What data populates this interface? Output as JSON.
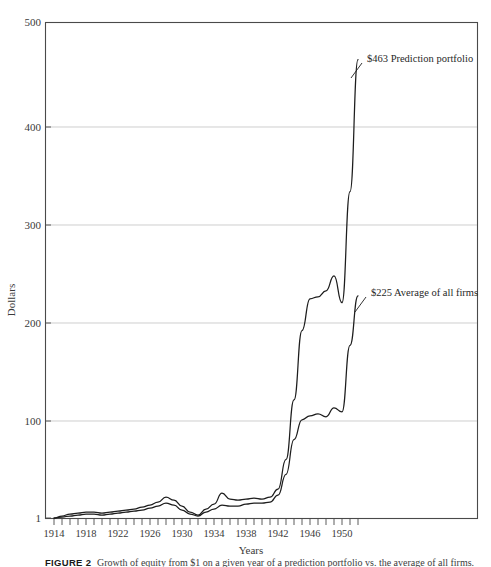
{
  "figure": {
    "caption_label": "FIGURE 2",
    "caption_text": "Growth of equity from $1 on a given year of a prediction portfolio vs. the average of all firms."
  },
  "chart_data": {
    "type": "line",
    "title": "",
    "xlabel": "Years",
    "ylabel": "Dollars",
    "xlim": [
      1914,
      1952
    ],
    "ylim": [
      1,
      500
    ],
    "grid": true,
    "grid_axis": "y",
    "legend_position": "inline-annotations",
    "y_ticks": [
      1,
      100,
      200,
      300,
      400,
      500
    ],
    "y_tick_labels": [
      "1",
      "100",
      "200",
      "300",
      "400",
      "500"
    ],
    "x_ticks": [
      1914,
      1915,
      1916,
      1917,
      1918,
      1919,
      1920,
      1921,
      1922,
      1923,
      1924,
      1925,
      1926,
      1927,
      1928,
      1929,
      1930,
      1931,
      1932,
      1933,
      1934,
      1935,
      1936,
      1937,
      1938,
      1939,
      1940,
      1941,
      1942,
      1943,
      1944,
      1945,
      1946,
      1947,
      1948,
      1949,
      1950,
      1951,
      1952
    ],
    "x_tick_labels": [
      "1914",
      "1918",
      "1922",
      "1926",
      "1930",
      "1934",
      "1938",
      "1942",
      "1946",
      "1950"
    ],
    "x_labeled_ticks": [
      1914,
      1918,
      1922,
      1926,
      1930,
      1934,
      1938,
      1942,
      1946,
      1950
    ],
    "series": [
      {
        "name": "Prediction portfolio",
        "end_value_label": "$463",
        "annotation": "$463  Prediction portfolio",
        "color": "#1d1d1d",
        "x": [
          1914,
          1915,
          1916,
          1917,
          1918,
          1919,
          1920,
          1921,
          1922,
          1923,
          1924,
          1925,
          1926,
          1927,
          1928,
          1929,
          1930,
          1931,
          1932,
          1933,
          1934,
          1935,
          1936,
          1937,
          1938,
          1939,
          1940,
          1941,
          1942,
          1943,
          1944,
          1945,
          1946,
          1947,
          1948,
          1949,
          1950,
          1951,
          1952
        ],
        "values": [
          1,
          3,
          5,
          6,
          7,
          7,
          6,
          7,
          8,
          9,
          10,
          12,
          14,
          17,
          22,
          19,
          13,
          7,
          4,
          10,
          15,
          26,
          20,
          19,
          20,
          21,
          20,
          22,
          30,
          60,
          120,
          190,
          222,
          224,
          230,
          245,
          218,
          330,
          463
        ]
      },
      {
        "name": "Average of all firms",
        "end_value_label": "$225",
        "annotation": "$225  Average of all firms",
        "color": "#1d1d1d",
        "x": [
          1914,
          1915,
          1916,
          1917,
          1918,
          1919,
          1920,
          1921,
          1922,
          1923,
          1924,
          1925,
          1926,
          1927,
          1928,
          1929,
          1930,
          1931,
          1932,
          1933,
          1934,
          1935,
          1936,
          1937,
          1938,
          1939,
          1940,
          1941,
          1942,
          1943,
          1944,
          1945,
          1946,
          1947,
          1948,
          1949,
          1950,
          1951,
          1952
        ],
        "values": [
          1,
          2,
          3,
          4,
          5,
          5,
          4,
          5,
          6,
          7,
          8,
          9,
          11,
          13,
          16,
          14,
          9,
          5,
          3,
          7,
          10,
          14,
          13,
          13,
          15,
          16,
          16,
          17,
          24,
          45,
          80,
          100,
          104,
          106,
          103,
          112,
          108,
          175,
          225
        ]
      }
    ],
    "annotations": [
      {
        "text": "$463  Prediction portfolio",
        "value": 463,
        "x_pos": 1951.2,
        "series": "Prediction portfolio"
      },
      {
        "text": "$225  Average of all firms",
        "value": 225,
        "x_pos": 1951.2,
        "series": "Average of all firms"
      }
    ]
  }
}
